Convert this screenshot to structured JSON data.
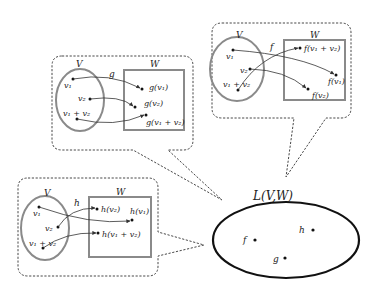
{
  "diagram": {
    "main_set": {
      "label": "L(V,W)",
      "elements": [
        {
          "name": "f",
          "label": "f"
        },
        {
          "name": "g",
          "label": "g"
        },
        {
          "name": "h",
          "label": "h"
        }
      ]
    },
    "panels": {
      "g": {
        "map_label": "g",
        "domain_label": "V",
        "codomain_label": "W",
        "domain_points": [
          "v₁",
          "v₂",
          "v₁ + v₂"
        ],
        "image_points": [
          "g(v₁)",
          "g(v₂)",
          "g(v₁ + v₂)"
        ]
      },
      "f": {
        "map_label": "f",
        "domain_label": "V",
        "codomain_label": "W",
        "domain_points": [
          "v₁",
          "v₂",
          "v₁ + v₂"
        ],
        "image_points": [
          "f(v₁ + v₂)",
          "f(v₁)",
          "f(v₂)"
        ]
      },
      "h": {
        "map_label": "h",
        "domain_label": "V",
        "codomain_label": "W",
        "domain_points": [
          "v₁",
          "v₂",
          "v₁ + v₂"
        ],
        "image_points": [
          "h(v₂)",
          "h(v₁)",
          "h(v₁ + v₂)"
        ]
      }
    }
  }
}
